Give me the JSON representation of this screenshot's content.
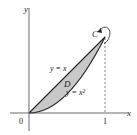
{
  "diagram": {
    "axes": {
      "x_label": "x",
      "y_label": "y",
      "origin_label": "0",
      "x_tick_label": "1"
    },
    "curves": [
      {
        "label": "y = x",
        "equation": "y=x"
      },
      {
        "label": "y = x²",
        "equation": "y=x^2"
      }
    ],
    "region_label": "D",
    "boundary_label": "C",
    "colors": {
      "region_fill": "#c8c8c8",
      "stroke": "#222222"
    }
  }
}
